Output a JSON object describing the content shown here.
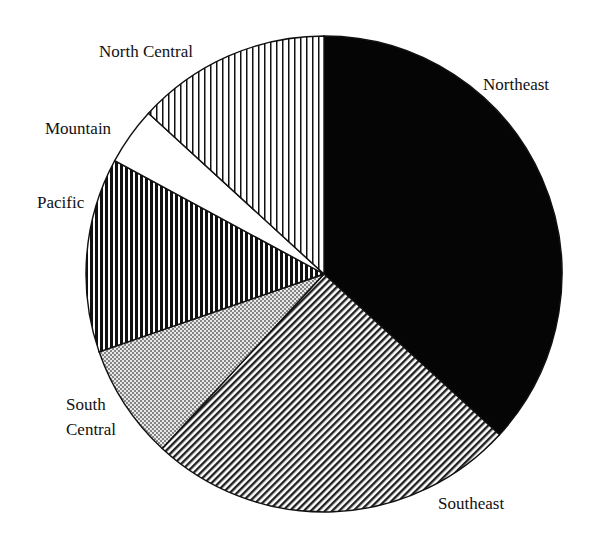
{
  "chart_data": {
    "type": "pie",
    "title": "",
    "start_angle_deg": 0,
    "direction": "clockwise",
    "slices": [
      {
        "label": "Northeast",
        "value": 36.8,
        "fill": "solid-black"
      },
      {
        "label": "Southeast",
        "value": 25.1,
        "fill": "diagonal-hatch"
      },
      {
        "label": "South Central",
        "value": 7.8,
        "fill": "dot-stipple"
      },
      {
        "label": "Pacific",
        "value": 13.2,
        "fill": "dense-vertical-lines"
      },
      {
        "label": "Mountain",
        "value": 3.9,
        "fill": "white"
      },
      {
        "label": "North Central",
        "value": 13.2,
        "fill": "sparse-vertical-lines"
      }
    ],
    "legend": "none (labels placed around pie)"
  },
  "labels": {
    "northeast": "Northeast",
    "southeast": "Southeast",
    "south_central_1": "South",
    "south_central_2": "Central",
    "pacific": "Pacific",
    "mountain": "Mountain",
    "north_central": "North Central"
  }
}
